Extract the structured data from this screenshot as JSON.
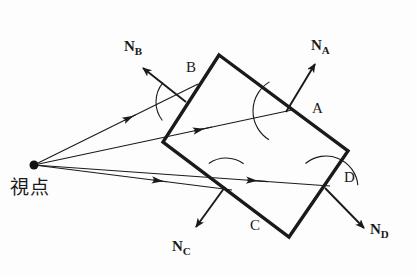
{
  "figure": {
    "type": "geometry-diagram",
    "title_text": "",
    "background_color": "#fdfdfd",
    "stroke_color": "#1a1a1a",
    "viewpoint": {
      "label": "視点",
      "label_x": 10,
      "label_y": 178,
      "point_x": 34,
      "point_y": 165,
      "dot_radius": 4.5
    },
    "polygon": {
      "name": "convex-quadrilateral",
      "stroke_width": 3.4,
      "vertices": [
        {
          "name": "top",
          "x": 219,
          "y": 55
        },
        {
          "name": "right",
          "x": 348,
          "y": 151
        },
        {
          "name": "bottom",
          "x": 289,
          "y": 237
        },
        {
          "name": "left",
          "x": 163,
          "y": 142
        }
      ]
    },
    "faces": [
      {
        "id": "A",
        "label": "A",
        "label_x": 312,
        "label_y": 101,
        "edge_from": "top",
        "edge_to": "right",
        "normal_label": "N",
        "normal_sub": "A",
        "normal_from_x": 286,
        "normal_from_y": 112,
        "normal_to_x": 315,
        "normal_to_y": 64,
        "normal_label_x": 311,
        "normal_label_y": 38,
        "visible": true
      },
      {
        "id": "B",
        "label": "B",
        "label_x": 186,
        "label_y": 60,
        "edge_from": "left",
        "edge_to": "top",
        "normal_label": "N",
        "normal_sub": "B",
        "normal_from_x": 186,
        "normal_from_y": 102,
        "normal_to_x": 143,
        "normal_to_y": 68,
        "normal_label_x": 124,
        "normal_label_y": 39,
        "visible": true
      },
      {
        "id": "C",
        "label": "C",
        "label_x": 250,
        "label_y": 218,
        "edge_from": "bottom",
        "edge_to": "left",
        "normal_label": "N",
        "normal_sub": "C",
        "normal_from_x": 225,
        "normal_from_y": 187,
        "normal_to_x": 196,
        "normal_to_y": 227,
        "normal_label_x": 172,
        "normal_label_y": 239,
        "visible": false
      },
      {
        "id": "D",
        "label": "D",
        "label_x": 344,
        "label_y": 170,
        "edge_from": "right",
        "edge_to": "bottom",
        "normal_label": "N",
        "normal_sub": "D",
        "normal_from_x": 325,
        "normal_from_y": 188,
        "normal_to_x": 364,
        "normal_to_y": 228,
        "normal_label_x": 370,
        "normal_label_y": 222,
        "visible": false
      }
    ],
    "view_rays": [
      {
        "name": "ray-to-face-B",
        "from_x": 34,
        "from_y": 165,
        "to_x": 198,
        "to_y": 84,
        "arrow_at": 0.55
      },
      {
        "name": "ray-to-face-A",
        "from_x": 34,
        "from_y": 165,
        "to_x": 292,
        "to_y": 110,
        "arrow_at": 0.62
      },
      {
        "name": "ray-to-face-C",
        "from_x": 34,
        "from_y": 165,
        "to_x": 232,
        "to_y": 190,
        "arrow_at": 0.6
      },
      {
        "name": "ray-to-face-D",
        "from_x": 34,
        "from_y": 165,
        "to_x": 330,
        "to_y": 186,
        "arrow_at": 0.72
      }
    ],
    "angle_arcs": [
      {
        "name": "angle-arc-B",
        "cx": 186,
        "cy": 102,
        "r": 30,
        "a0": 140,
        "a1": 218
      },
      {
        "name": "angle-arc-A",
        "cx": 287,
        "cy": 111,
        "r": 34,
        "a0": 121,
        "a1": 238
      },
      {
        "name": "angle-arc-C",
        "cx": 226,
        "cy": 188,
        "r": 30,
        "a0": 54,
        "a1": 125
      },
      {
        "name": "angle-arc-D",
        "cx": 326,
        "cy": 188,
        "r": 32,
        "a0": 5,
        "a1": 130
      }
    ]
  }
}
